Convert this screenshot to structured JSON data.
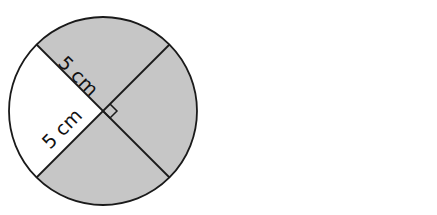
{
  "diagram": {
    "labels": [
      {
        "text": "5 cm",
        "position": "upper-left radius"
      },
      {
        "text": "5 cm",
        "position": "lower-left radius"
      }
    ],
    "right_angle_marker": true,
    "colors": {
      "shade": "#c6c6c6",
      "stroke": "#1a1a1a",
      "unshaded": "#ffffff"
    }
  }
}
